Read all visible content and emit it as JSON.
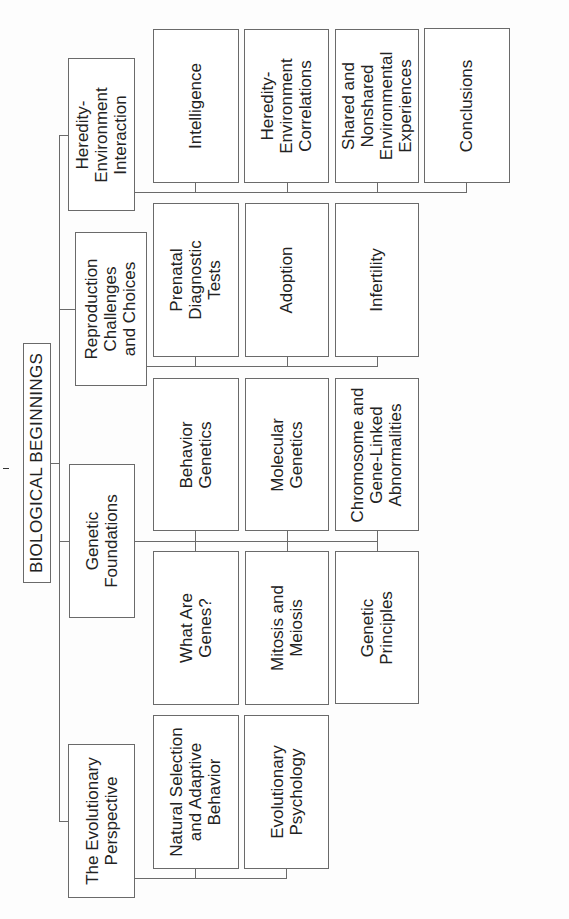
{
  "title": "BIOLOGICAL BEGINNINGS",
  "sections": [
    {
      "label": "The Evolutionary\nPerspective",
      "subtopics": [
        "Natural Selection\nand Adaptive\nBehavior",
        "Evolutionary\nPsychology"
      ]
    },
    {
      "label": "Genetic\nFoundations",
      "subtopics_row_a": [
        "Behavior\nGenetics",
        "Molecular\nGenetics",
        "Chromosome and\nGene-Linked\nAbnormalities"
      ],
      "subtopics_row_b": [
        "What Are\nGenes?",
        "Mitosis and\nMeiosis",
        "Genetic\nPrinciples"
      ]
    },
    {
      "label": "Reproduction\nChallenges\nand Choices",
      "subtopics": [
        "Prenatal\nDiagnostic\nTests",
        "Adoption",
        "Infertility"
      ]
    },
    {
      "label": "Heredity-\nEnvironment\nInteraction",
      "subtopics": [
        "Intelligence",
        "Heredity-\nEnvironment\nCorrelations",
        "Shared and\nNonshared\nEnvironmental\nExperiences",
        "Conclusions"
      ]
    }
  ],
  "colors": {
    "line": "#6a6a6a",
    "box_fill": "#ffffff",
    "text": "#222222"
  }
}
